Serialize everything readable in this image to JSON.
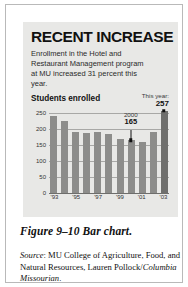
{
  "panel": {
    "title": "RECENT INCREASE",
    "deck": "Enrollment in the Hotel and Restaurant Management program at MU increased 31 percent this year.",
    "subhead": "Students enrolled",
    "this_year_label": "This year:",
    "this_year_value": "257"
  },
  "caption": {
    "text": "Figure 9–10  Bar chart."
  },
  "source": {
    "label": "Source",
    "colon": ":",
    "body": " MU College of Agriculture, Food, and Natural Resources, Lauren Pollock/",
    "publication": "Columbia Missourian",
    "period": "."
  },
  "colors": {
    "panel_background": "#e8e8e6",
    "bar": "#8d8d8b",
    "bar_highlight": "#6f6f6d",
    "gridline": "#a8a8a6",
    "axis": "#6e6e6c",
    "text": "#111111",
    "page_background": "#ffffff",
    "frame_border": "#b9b9b9"
  },
  "chart_data": {
    "type": "bar",
    "title": "RECENT INCREASE",
    "subtitle": "Students enrolled",
    "xlabel": "",
    "ylabel": "Students enrolled",
    "ylim": [
      0,
      250
    ],
    "yticks": [
      0,
      50,
      100,
      150,
      200,
      250
    ],
    "ytick_labels": [
      "0",
      "50",
      "100",
      "150",
      "200",
      "250"
    ],
    "grid": true,
    "legend": "none",
    "categories": [
      "'93",
      "'94",
      "'95",
      "'96",
      "'97",
      "'98",
      "'99",
      "'00",
      "'01",
      "'02",
      "'03"
    ],
    "xtick_labels": [
      "'93",
      "'95",
      "'97",
      "'99",
      "'01",
      "'03"
    ],
    "xtick_indices": [
      0,
      2,
      4,
      6,
      8,
      10
    ],
    "values": [
      240,
      225,
      190,
      189,
      190,
      186,
      169,
      165,
      160,
      190,
      257
    ],
    "annotations": [
      {
        "label": "2000",
        "value": "165",
        "index": 7
      },
      {
        "label": "This year:",
        "value": "257",
        "index": 10
      }
    ]
  }
}
